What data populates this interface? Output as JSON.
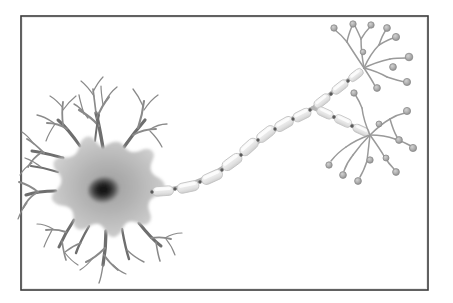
{
  "figure": {
    "kind": "scientific-illustration",
    "style": "grayscale pencil/airbrush drawing on white background, enclosed in a thin dark rectangular frame",
    "caption": "",
    "background_color": "#ffffff"
  },
  "frame": {
    "name": "illustration-border",
    "x": 21,
    "y": 16,
    "width": 407,
    "height": 274,
    "stroke_color": "#3a3a3a",
    "stroke_width": 1.6,
    "fill_color": "#ffffff"
  },
  "colors": {
    "soma_fill_outer": "#c9c9c9",
    "soma_fill_mid": "#b0b0b0",
    "nucleus_dark": "#1a1a1a",
    "nucleus_mid": "#4a4a4a",
    "dendrite_stroke": "#8a8a8a",
    "dendrite_stroke_dark": "#6e6e6e",
    "myelin_fill": "#ededed",
    "myelin_stroke": "#c4c4c4",
    "node_color": "#5a5a5a",
    "axon_core": "#b5b5b5",
    "terminal_branch_stroke": "#9a9a9a",
    "bouton_fill": "#b0b0b0",
    "bouton_stroke": "#8c8c8c"
  },
  "parts": [
    {
      "id": "soma",
      "label": "Soma (cell body)",
      "center_x": 103,
      "center_y": 190,
      "radius_x": 48,
      "radius_y": 42,
      "description": "star-shaped gray cell body from which dendrites radiate"
    },
    {
      "id": "nucleus",
      "label": "Nucleus",
      "center_x": 104,
      "center_y": 190,
      "radius_x": 16,
      "radius_y": 13,
      "description": "dark radial-gradient nucleus at the centre of the soma"
    },
    {
      "id": "dendrites",
      "label": "Dendrites",
      "count": 12,
      "description": "branching tapered processes radiating in all directions from the soma, each forking two or three times"
    },
    {
      "id": "axon-hillock",
      "label": "Axon hillock",
      "x": 150,
      "y": 188,
      "description": "cone where the axon leaves the soma on the right side"
    },
    {
      "id": "myelin-sheath",
      "label": "Myelin sheath",
      "segment_count": 15,
      "description": "chain of pale elongated capsules wrapping the axon"
    },
    {
      "id": "nodes-of-ranvier",
      "label": "Nodes of Ranvier",
      "count": 14,
      "description": "small dark gaps between consecutive myelin segments"
    },
    {
      "id": "axon-branch-point",
      "label": "Axon bifurcation",
      "x": 313,
      "y": 108,
      "description": "axon splits into an upper-right and a lower-right terminal branch"
    },
    {
      "id": "terminal-arbor-upper",
      "label": "Upper axon terminal arbor",
      "origin_x": 356,
      "origin_y": 73,
      "bouton_count": 10,
      "description": "fan of thin branches ending in round synaptic boutons, upper right corner"
    },
    {
      "id": "terminal-arbor-lower",
      "label": "Lower axon terminal arbor",
      "origin_x": 363,
      "origin_y": 131,
      "bouton_count": 11,
      "description": "fan of thin branches ending in round synaptic boutons, lower right"
    }
  ],
  "geometry": {
    "soma_outline": "M103,148 C112,141 120,140 124,147 C128,153 134,154 141,151 C150,147 156,152 152,160 C148,168 150,174 158,178 C167,183 166,192 157,195 C149,198 146,204 149,212 C153,221 147,227 139,223 C131,219 125,221 122,229 C118,238 110,239 106,231 C102,223 96,221 89,226 C81,232 73,229 74,220 C75,211 71,206 62,205 C53,204 49,197 56,191 C63,185 64,178 58,172 C51,165 54,157 63,158 C72,159 78,155 80,146 C82,137 90,134 95,141 C98,145 100,147 103,148 Z",
    "dendrites": [
      {
        "path": "M103,148 C101,136 99,124 96,113",
        "w": 3.4,
        "branches": [
          {
            "path": "M99,126 C93,119 86,114 79,110",
            "w": 2.2,
            "branches": [
              {
                "path": "M88,118 C84,112 80,107 74,104",
                "w": 1.4
              },
              {
                "path": "M84,114 C82,107 80,101 79,95",
                "w": 1.3
              }
            ]
          },
          {
            "path": "M97,118 C100,110 104,103 109,97",
            "w": 2.0,
            "branches": [
              {
                "path": "M105,102 C108,96 112,91 117,87",
                "w": 1.3
              },
              {
                "path": "M103,105 C102,98 101,92 101,86",
                "w": 1.2
              }
            ]
          },
          {
            "path": "M96,113 C95,105 94,97 93,89",
            "w": 1.7,
            "branches": [
              {
                "path": "M94,96 C90,90 86,85 81,81",
                "w": 1.2
              },
              {
                "path": "M93,92 C96,86 99,81 103,77",
                "w": 1.2
              }
            ]
          }
        ]
      },
      {
        "path": "M124,147 C131,137 138,128 145,120",
        "w": 3.2,
        "branches": [
          {
            "path": "M138,128 C141,119 143,110 144,101",
            "w": 2.1,
            "branches": [
              {
                "path": "M144,110 C148,104 152,99 158,95",
                "w": 1.3
              },
              {
                "path": "M143,106 C140,99 137,94 133,89",
                "w": 1.3
              }
            ]
          },
          {
            "path": "M133,135 C140,131 148,129 156,129",
            "w": 1.9,
            "branches": [
              {
                "path": "M149,130 C155,126 161,124 167,124",
                "w": 1.3
              },
              {
                "path": "M150,131 C155,136 159,141 162,147",
                "w": 1.2
              }
            ]
          }
        ]
      },
      {
        "path": "M80,146 C73,136 66,127 58,120",
        "w": 3.0,
        "branches": [
          {
            "path": "M67,129 C61,125 54,123 47,123",
            "w": 2.0,
            "branches": [
              {
                "path": "M54,123 C48,119 43,116 37,115",
                "w": 1.3
              },
              {
                "path": "M55,124 C51,130 48,135 46,141",
                "w": 1.2
              }
            ]
          },
          {
            "path": "M63,125 C62,117 62,109 63,102",
            "w": 1.8,
            "branches": [
              {
                "path": "M63,110 C67,104 71,100 76,96",
                "w": 1.2
              },
              {
                "path": "M63,108 C59,103 55,99 50,96",
                "w": 1.2
              }
            ]
          }
        ]
      },
      {
        "path": "M63,158 C52,155 42,152 32,151",
        "w": 3.0,
        "branches": [
          {
            "path": "M44,153 C38,147 33,142 27,139",
            "w": 1.9,
            "branches": [
              {
                "path": "M34,144 C30,139 27,135 22,132",
                "w": 1.2
              }
            ]
          },
          {
            "path": "M42,152 C36,156 31,161 28,167",
            "w": 1.7,
            "branches": [
              {
                "path": "M32,163 C27,166 23,170 20,175",
                "w": 1.2
              }
            ]
          }
        ]
      },
      {
        "path": "M56,191 C45,191 35,192 26,195",
        "w": 3.1,
        "branches": [
          {
            "path": "M38,192 C32,187 26,184 19,182",
            "w": 1.9
          },
          {
            "path": "M36,193 C30,197 26,202 23,208",
            "w": 1.8,
            "branches": [
              {
                "path": "M27,203 C23,208 20,213 18,219",
                "w": 1.2
              }
            ]
          }
        ]
      },
      {
        "path": "M74,220 C68,229 63,238 59,247",
        "w": 3.0,
        "branches": [
          {
            "path": "M66,232 C60,230 53,229 46,230",
            "w": 1.9,
            "branches": [
              {
                "path": "M53,229 C48,226 43,224 37,224",
                "w": 1.2
              },
              {
                "path": "M52,230 C49,236 46,241 44,247",
                "w": 1.2
              }
            ]
          },
          {
            "path": "M62,241 C63,248 64,254 66,260",
            "w": 1.7,
            "branches": [
              {
                "path": "M65,253 C69,258 73,262 78,265",
                "w": 1.2
              }
            ]
          }
        ]
      },
      {
        "path": "M106,231 C106,243 105,254 103,265",
        "w": 3.3,
        "branches": [
          {
            "path": "M105,248 C99,254 93,259 86,262",
            "w": 2.0,
            "branches": [
              {
                "path": "M93,258 C89,263 85,267 80,270",
                "w": 1.2
              }
            ]
          },
          {
            "path": "M104,255 C108,261 113,266 118,270",
            "w": 1.8,
            "branches": [
              {
                "path": "M113,265 C117,269 121,272 126,274",
                "w": 1.2
              }
            ]
          },
          {
            "path": "M103,265 C102,272 101,278 99,283",
            "w": 1.4
          }
        ]
      },
      {
        "path": "M139,223 C146,232 153,240 161,246",
        "w": 3.0,
        "branches": [
          {
            "path": "M151,238 C158,237 164,237 171,239",
            "w": 1.9,
            "branches": [
              {
                "path": "M165,238 C170,235 176,233 182,233",
                "w": 1.2
              },
              {
                "path": "M166,239 C170,244 173,249 175,255",
                "w": 1.2
              }
            ]
          },
          {
            "path": "M156,242 C157,249 158,255 160,261",
            "w": 1.6
          }
        ]
      },
      {
        "path": "M122,229 C124,240 126,250 129,259",
        "w": 2.4,
        "branches": [
          {
            "path": "M127,250 C132,255 138,259 144,262",
            "w": 1.4
          }
        ]
      },
      {
        "path": "M89,226 C84,235 79,244 76,253",
        "w": 2.4,
        "branches": [
          {
            "path": "M81,243 C75,245 70,248 65,252",
            "w": 1.4
          }
        ]
      },
      {
        "path": "M58,172 C49,169 40,167 31,166",
        "w": 2.2,
        "branches": [
          {
            "path": "M41,167 C36,163 31,160 25,158",
            "w": 1.3
          }
        ]
      },
      {
        "path": "M95,141 C96,132 97,123 99,115",
        "w": 2.0
      }
    ],
    "axon_spine": "M152,191 C180,190 206,180 228,164 C252,147 275,128 295,117 C303,112 308,110 313,108",
    "myelin_segments_main": [
      {
        "cx": 163,
        "cy": 191,
        "len": 21,
        "w": 9.5,
        "angle": -4
      },
      {
        "cx": 188,
        "cy": 187,
        "len": 22,
        "w": 10,
        "angle": -12
      },
      {
        "cx": 212,
        "cy": 177,
        "len": 22,
        "w": 10,
        "angle": -24
      },
      {
        "cx": 232,
        "cy": 162,
        "len": 22,
        "w": 10.5,
        "angle": -36
      },
      {
        "cx": 249,
        "cy": 147,
        "len": 21,
        "w": 10.5,
        "angle": -42
      },
      {
        "cx": 266,
        "cy": 134,
        "len": 21,
        "w": 10,
        "angle": -38
      },
      {
        "cx": 284,
        "cy": 124,
        "len": 20,
        "w": 10,
        "angle": -30
      },
      {
        "cx": 302,
        "cy": 115,
        "len": 19,
        "w": 9.5,
        "angle": -26
      }
    ],
    "upper_branch_spine": "M313,108 C325,98 340,86 356,74",
    "myelin_segments_upper": [
      {
        "cx": 322,
        "cy": 101,
        "len": 18,
        "w": 8.5,
        "angle": -38
      },
      {
        "cx": 340,
        "cy": 87,
        "len": 18,
        "w": 8.5,
        "angle": -38
      },
      {
        "cx": 356,
        "cy": 75,
        "len": 16,
        "w": 8,
        "angle": -38
      }
    ],
    "lower_branch_spine": "M313,108 C328,114 346,123 364,131",
    "myelin_segments_lower": [
      {
        "cx": 325,
        "cy": 113,
        "len": 17,
        "w": 8.5,
        "angle": 25
      },
      {
        "cx": 343,
        "cy": 121,
        "len": 18,
        "w": 8.5,
        "angle": 25
      },
      {
        "cx": 361,
        "cy": 130,
        "len": 17,
        "w": 8,
        "angle": 25
      }
    ],
    "nodes": [
      {
        "x": 152,
        "y": 192
      },
      {
        "x": 175,
        "y": 189
      },
      {
        "x": 200,
        "y": 182
      },
      {
        "x": 222,
        "y": 170
      },
      {
        "x": 241,
        "y": 155
      },
      {
        "x": 258,
        "y": 140
      },
      {
        "x": 275,
        "y": 129
      },
      {
        "x": 293,
        "y": 119
      },
      {
        "x": 310,
        "y": 110
      },
      {
        "x": 331,
        "y": 94
      },
      {
        "x": 348,
        "y": 81
      },
      {
        "x": 334,
        "y": 117
      },
      {
        "x": 352,
        "y": 126
      }
    ],
    "terminal_upper": {
      "origin": [
        364,
        68
      ],
      "branches": [
        "M364,68 C358,59 352,50 347,42",
        "M347,42 C343,37 339,33 335,30",
        "M347,42 C348,36 350,31 352,26",
        "M364,68 C362,57 361,48 361,39",
        "M361,39 C359,34 357,30 355,26",
        "M361,39 C364,34 367,30 370,27",
        "M364,68 C368,59 373,51 379,45",
        "M379,45 C384,42 389,39 394,38",
        "M379,45 C381,39 383,34 386,30",
        "M364,68 C372,64 381,61 390,59",
        "M390,59 C396,58 402,58 407,58",
        "M364,68 C372,70 380,73 387,77",
        "M387,77 C393,79 399,81 405,82",
        "M364,68 C368,74 372,80 375,86"
      ],
      "boutons": [
        {
          "x": 334,
          "y": 28,
          "r": 3.2
        },
        {
          "x": 353,
          "y": 24,
          "r": 3.2
        },
        {
          "x": 371,
          "y": 25,
          "r": 3.2
        },
        {
          "x": 387,
          "y": 28,
          "r": 3.4
        },
        {
          "x": 396,
          "y": 37,
          "r": 3.6
        },
        {
          "x": 409,
          "y": 57,
          "r": 3.8
        },
        {
          "x": 407,
          "y": 82,
          "r": 3.6
        },
        {
          "x": 377,
          "y": 88,
          "r": 3.4
        },
        {
          "x": 393,
          "y": 67,
          "r": 3.4
        },
        {
          "x": 363,
          "y": 52,
          "r": 2.8
        }
      ]
    },
    "terminal_lower": {
      "origin": [
        370,
        135
      ],
      "branches": [
        "M370,135 C366,126 363,117 362,108",
        "M362,108 C360,103 358,99 356,96",
        "M370,135 C376,129 383,123 390,119",
        "M390,119 C395,116 400,114 405,113",
        "M390,119 C392,126 394,132 397,137",
        "M370,135 C378,135 387,136 395,139",
        "M395,139 C401,141 406,143 411,146",
        "M370,135 C375,142 380,149 384,156",
        "M384,156 C387,161 390,165 394,169",
        "M370,135 C369,144 368,152 367,161",
        "M367,161 C365,167 363,172 360,177",
        "M370,135 C364,141 358,148 353,155",
        "M353,155 C349,160 346,165 344,171",
        "M370,135 C361,138 353,142 346,147",
        "M346,147 C340,151 335,156 331,161"
      ],
      "boutons": [
        {
          "x": 354,
          "y": 93,
          "r": 3.2
        },
        {
          "x": 407,
          "y": 111,
          "r": 3.6
        },
        {
          "x": 399,
          "y": 140,
          "r": 3.4
        },
        {
          "x": 413,
          "y": 148,
          "r": 3.6
        },
        {
          "x": 396,
          "y": 172,
          "r": 3.4
        },
        {
          "x": 358,
          "y": 181,
          "r": 3.4
        },
        {
          "x": 343,
          "y": 175,
          "r": 3.4
        },
        {
          "x": 329,
          "y": 165,
          "r": 3.2
        },
        {
          "x": 379,
          "y": 124,
          "r": 3.0
        },
        {
          "x": 370,
          "y": 160,
          "r": 3.2
        },
        {
          "x": 386,
          "y": 158,
          "r": 3.0
        }
      ]
    }
  }
}
